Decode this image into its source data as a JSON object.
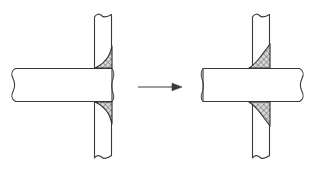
{
  "figure": {
    "type": "engineering-cross-section",
    "background_color": "#ffffff",
    "line_color": "#3a3a3a",
    "weld_fill_color": "#b9b9b9",
    "plate_fill_color": "#ffffff",
    "canvas": {
      "width": 315,
      "height": 173
    }
  },
  "panels": [
    {
      "id": "before",
      "name": "left-figure",
      "label": "",
      "vertical_plate": {
        "name": "vertical-plate",
        "x_left": 94,
        "x_right": 112,
        "y_top": 14,
        "y_bottom": 158,
        "break_lines": [
          "top",
          "bottom"
        ]
      },
      "horizontal_plate": {
        "name": "horizontal-plate",
        "x_left": 12,
        "x_right": 112,
        "y_top": 68,
        "y_bottom": 102,
        "break_lines": [
          "left"
        ]
      },
      "welds": [
        {
          "name": "upper-fillet-weld",
          "position": "top-right",
          "profile": "concave",
          "hatch": "crosshatch"
        },
        {
          "name": "lower-fillet-weld",
          "position": "bottom-right",
          "profile": "concave",
          "hatch": "crosshatch"
        }
      ]
    },
    {
      "id": "after",
      "name": "right-figure",
      "label": "",
      "vertical_plate": {
        "name": "vertical-plate",
        "x_left": 252,
        "x_right": 270,
        "y_top": 14,
        "y_bottom": 158,
        "break_lines": [
          "top",
          "bottom"
        ]
      },
      "horizontal_plate": {
        "name": "horizontal-plate",
        "x_left": 203,
        "x_right": 303,
        "y_top": 68,
        "y_bottom": 102,
        "break_lines": [
          "right"
        ]
      },
      "welds": [
        {
          "name": "upper-fillet-weld",
          "position": "top-right",
          "profile": "convex",
          "hatch": "crosshatch"
        },
        {
          "name": "lower-fillet-weld",
          "position": "bottom-right",
          "profile": "convex",
          "hatch": "crosshatch"
        }
      ]
    }
  ],
  "arrow": {
    "name": "transformation-arrow",
    "label": "",
    "direction": "right",
    "x_start": 138,
    "x_end": 182,
    "y": 87
  }
}
